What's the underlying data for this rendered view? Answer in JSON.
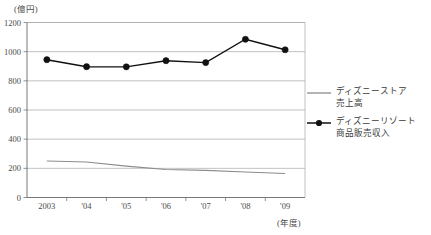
{
  "chart_data": {
    "type": "line",
    "title": "",
    "subtitle": "",
    "xlabel": "(年度)",
    "ylabel": "(億円)",
    "unit_top": "(億円)",
    "unit_bottom": "(年度)",
    "categories": [
      "2003",
      "'04",
      "'05",
      "'06",
      "'07",
      "'08",
      "'09"
    ],
    "yticks": [
      "0",
      "200",
      "400",
      "600",
      "800",
      "1000",
      "1200"
    ],
    "ytick_values": [
      0,
      200,
      400,
      600,
      800,
      1000,
      1200
    ],
    "ylim": [
      0,
      1200
    ],
    "grid": true,
    "legend_position": "right",
    "series": [
      {
        "name": "ディズニーストア 売上高",
        "name_line1": "ディズニーストア",
        "name_line2": "売上高",
        "color": "#8c8c8c",
        "marker": "none",
        "values": [
          250,
          243,
          215,
          192,
          186,
          175,
          165
        ]
      },
      {
        "name": "ディズニーリゾート 商品販売収入",
        "name_line1": "ディズニーリゾート",
        "name_line2": "商品販売収入",
        "color": "#111111",
        "marker": "circle",
        "values": [
          945,
          897,
          896,
          938,
          925,
          1085,
          1013
        ]
      }
    ]
  },
  "legend": {
    "items": [
      {
        "line1": "ディズニーストア",
        "line2": "売上高",
        "marker": "line-plain"
      },
      {
        "line1": "ディズニーリゾート",
        "line2": "商品販売収入",
        "marker": "line-circle"
      }
    ]
  }
}
